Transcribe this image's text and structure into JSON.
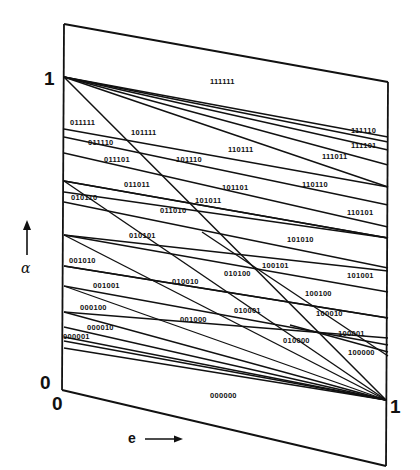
{
  "diagram": {
    "axes": {
      "vertical_label": "α",
      "horizontal_label": "e",
      "left_top_value": "1",
      "left_bottom_value": "0",
      "bottom_left_value": "0",
      "bottom_right_value": "1"
    },
    "regions": [
      {
        "code": "111111",
        "x": 210,
        "y": 84
      },
      {
        "code": "111110",
        "x": 351,
        "y": 133
      },
      {
        "code": "111101",
        "x": 351,
        "y": 148
      },
      {
        "code": "111011",
        "x": 322,
        "y": 159
      },
      {
        "code": "011111",
        "x": 70,
        "y": 125
      },
      {
        "code": "101111",
        "x": 131,
        "y": 135
      },
      {
        "code": "011110",
        "x": 88,
        "y": 145
      },
      {
        "code": "110111",
        "x": 228,
        "y": 152
      },
      {
        "code": "011101",
        "x": 104,
        "y": 162
      },
      {
        "code": "101110",
        "x": 176,
        "y": 162
      },
      {
        "code": "110110",
        "x": 302,
        "y": 187
      },
      {
        "code": "011011",
        "x": 124,
        "y": 187
      },
      {
        "code": "101101",
        "x": 222,
        "y": 190
      },
      {
        "code": "010110",
        "x": 71,
        "y": 200
      },
      {
        "code": "101011",
        "x": 195,
        "y": 203
      },
      {
        "code": "011010",
        "x": 160,
        "y": 213
      },
      {
        "code": "110101",
        "x": 347,
        "y": 215
      },
      {
        "code": "010101",
        "x": 129,
        "y": 238
      },
      {
        "code": "101010",
        "x": 287,
        "y": 242
      },
      {
        "code": "001010",
        "x": 69,
        "y": 263
      },
      {
        "code": "100101",
        "x": 262,
        "y": 268
      },
      {
        "code": "010100",
        "x": 224,
        "y": 276
      },
      {
        "code": "101001",
        "x": 347,
        "y": 278
      },
      {
        "code": "001001",
        "x": 93,
        "y": 288
      },
      {
        "code": "010010",
        "x": 172,
        "y": 284
      },
      {
        "code": "100100",
        "x": 305,
        "y": 296
      },
      {
        "code": "000100",
        "x": 80,
        "y": 310
      },
      {
        "code": "010001",
        "x": 234,
        "y": 313
      },
      {
        "code": "100010",
        "x": 316,
        "y": 316
      },
      {
        "code": "001000",
        "x": 180,
        "y": 322
      },
      {
        "code": "000010",
        "x": 87,
        "y": 330
      },
      {
        "code": "100001",
        "x": 338,
        "y": 336
      },
      {
        "code": "000001",
        "x": 63,
        "y": 339
      },
      {
        "code": "010000",
        "x": 283,
        "y": 343
      },
      {
        "code": "100000",
        "x": 348,
        "y": 355
      },
      {
        "code": "000000",
        "x": 210,
        "y": 398
      }
    ]
  }
}
